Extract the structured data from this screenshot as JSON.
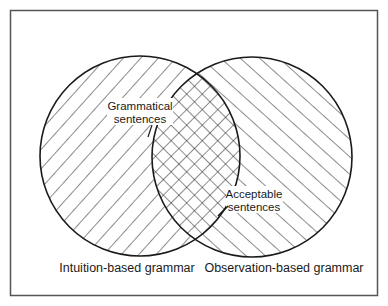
{
  "diagram": {
    "type": "venn",
    "colors": {
      "stroke": "#1a1a1a",
      "frame": "#555555",
      "background": "#ffffff",
      "label_bg": "#ffffff"
    },
    "frame": {
      "x": 10,
      "y": 10,
      "width": 368,
      "height": 286
    },
    "sets": [
      {
        "id": "intuition",
        "label": "Intuition-based grammar",
        "circle": {
          "cx": 140,
          "cy": 156,
          "r": 100
        },
        "hatch": "backslash"
      },
      {
        "id": "observation",
        "label": "Observation-based grammar",
        "circle": {
          "cx": 252,
          "cy": 157,
          "r": 100
        },
        "hatch": "slash"
      }
    ],
    "overlap": {
      "hatch": "cross"
    },
    "annotations": [
      {
        "id": "grammatical",
        "lines": [
          "Grammatical",
          "sentences"
        ]
      },
      {
        "id": "acceptable",
        "lines": [
          "Acceptable",
          "sentences"
        ]
      }
    ]
  }
}
